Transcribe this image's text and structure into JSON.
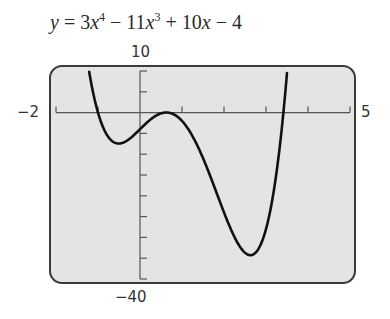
{
  "chart_data": {
    "type": "line",
    "function": "3x^4 - 11x^3 + 10x - 4",
    "xlabel": "",
    "ylabel": "",
    "xlim": [
      -2,
      5
    ],
    "ylim": [
      -40,
      10
    ],
    "x_tick_step": 1,
    "y_tick_step": 5,
    "window_labels": {
      "xmin": "−2",
      "xmax": "5",
      "ymin": "−40",
      "ymax": "10"
    },
    "grid": false,
    "legend": null,
    "key_points": [
      {
        "label": "local min",
        "x": -0.6,
        "y": -8.6
      },
      {
        "label": "local max",
        "x": 0.56,
        "y": -0.6
      },
      {
        "label": "local min",
        "x": 2.63,
        "y": -34.2
      }
    ],
    "series": [
      {
        "name": "y",
        "x": [
          -1.4,
          -1.2,
          -1.0,
          -0.8,
          -0.6,
          -0.4,
          -0.2,
          0.0,
          0.2,
          0.4,
          0.6,
          0.8,
          1.0,
          1.2,
          1.4,
          1.6,
          1.8,
          2.0,
          2.2,
          2.4,
          2.6,
          2.8,
          3.0,
          3.2,
          3.4
        ],
        "values": [
          9.6,
          0.8,
          -4.0,
          -6.1,
          -6.6,
          -6.1,
          -5.9,
          -4.0,
          -2.1,
          -0.6,
          -0.0,
          -0.4,
          -2.0,
          -5.1,
          -9.4,
          -14.7,
          -20.6,
          -26.0,
          -30.5,
          -33.4,
          -34.2,
          -32.2,
          -25.0,
          -11.4,
          10.3
        ]
      }
    ],
    "colors": {
      "frame_fill": "#e4e4e4",
      "frame_stroke": "#3a3a3a",
      "curve": "#111111",
      "axes": "#555555"
    }
  },
  "title": {
    "y": "y",
    "eq": " = 3",
    "x1": "x",
    "p4": "4",
    "mid": " − 11",
    "x2": "x",
    "p3": "3",
    "plus": " + 10",
    "x3": "x",
    "end": " − 4"
  },
  "labels": {
    "ymax": "10",
    "xmin": "−2",
    "xmax": "5",
    "ymin": "−40"
  }
}
